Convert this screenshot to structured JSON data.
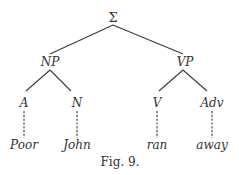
{
  "diagram": {
    "type": "syntax-tree",
    "root": {
      "label": "Σ",
      "x": 113,
      "y": 22
    },
    "nodes": {
      "np": {
        "label": "NP",
        "x": 50,
        "y": 66
      },
      "vp": {
        "label": "VP",
        "x": 185,
        "y": 66
      },
      "a": {
        "label": "A",
        "x": 24,
        "y": 107
      },
      "n": {
        "label": "N",
        "x": 77,
        "y": 107
      },
      "v": {
        "label": "V",
        "x": 157,
        "y": 107
      },
      "adv": {
        "label": "Adv",
        "x": 212,
        "y": 107
      }
    },
    "leaves": {
      "poor": {
        "label": "Poor",
        "x": 24,
        "y": 149
      },
      "john": {
        "label": "John",
        "x": 77,
        "y": 149
      },
      "ran": {
        "label": "ran",
        "x": 157,
        "y": 149
      },
      "away": {
        "label": "away",
        "x": 212,
        "y": 149
      }
    },
    "caption": "Fig. 9."
  }
}
